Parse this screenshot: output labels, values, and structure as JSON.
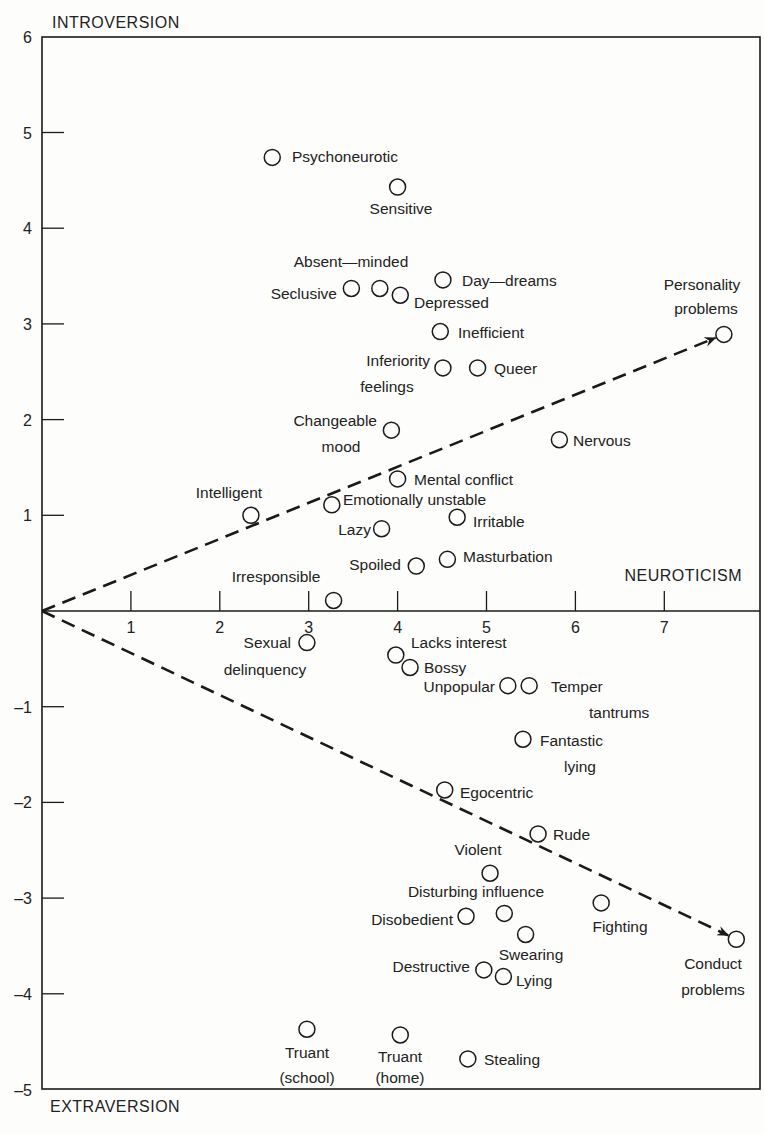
{
  "chart_data": {
    "type": "scatter",
    "title": "",
    "xlabel": "NEUROTICISM",
    "ylabel_top": "INTROVERSION",
    "ylabel_bottom": "EXTRAVERSION",
    "xlim": [
      0,
      7.6
    ],
    "ylim": [
      -5,
      6
    ],
    "x_ticks": [
      1,
      2,
      3,
      4,
      5,
      6,
      7
    ],
    "y_ticks": [
      6,
      5,
      4,
      3,
      2,
      1,
      -1,
      -2,
      -3,
      -4,
      -5
    ],
    "grid": false,
    "marker": "open-circle",
    "vectors": [
      {
        "name": "Personality problems",
        "from": [
          0,
          0
        ],
        "to": [
          7.67,
          2.89
        ],
        "style": "dashed-arrow"
      },
      {
        "name": "Conduct problems",
        "from": [
          0,
          0
        ],
        "to": [
          7.81,
          -3.43
        ],
        "style": "dashed-arrow"
      }
    ],
    "points": [
      {
        "label": "Psychoneurotic",
        "x": 2.59,
        "y": 4.74,
        "lx": 292,
        "ly": 162,
        "anchor": "start"
      },
      {
        "label": "Sensitive",
        "x": 4.0,
        "y": 4.43,
        "lx": 401,
        "ly": 214,
        "anchor": "middle"
      },
      {
        "label": "Absent—minded",
        "x": 3.8,
        "y": 3.37,
        "lx": 351,
        "ly": 267,
        "anchor": "middle"
      },
      {
        "label": "Seclusive",
        "x": 3.48,
        "y": 3.37,
        "lx": 337,
        "ly": 299,
        "anchor": "end"
      },
      {
        "label": "Depressed",
        "x": 4.03,
        "y": 3.3,
        "lx": 414,
        "ly": 308,
        "anchor": "start"
      },
      {
        "label": "Day—dreams",
        "x": 4.51,
        "y": 3.46,
        "lx": 462,
        "ly": 286,
        "anchor": "start"
      },
      {
        "label": "Inefficient",
        "x": 4.48,
        "y": 2.92,
        "lx": 458,
        "ly": 338,
        "anchor": "start"
      },
      {
        "label": "Inferiority",
        "label2": "feelings",
        "x": 4.51,
        "y": 2.54,
        "lx": 430,
        "ly": 366,
        "anchor": "end",
        "l2x": 387,
        "l2y": 392
      },
      {
        "label": "Queer",
        "x": 4.9,
        "y": 2.54,
        "lx": 494,
        "ly": 374,
        "anchor": "start"
      },
      {
        "label": "Changeable",
        "label2": "mood",
        "x": 3.93,
        "y": 1.89,
        "lx": 377,
        "ly": 426,
        "anchor": "end",
        "l2x": 341,
        "l2y": 452
      },
      {
        "label": "Nervous",
        "x": 5.82,
        "y": 1.79,
        "lx": 573,
        "ly": 446,
        "anchor": "start"
      },
      {
        "label": "Mental  conflict",
        "x": 4.0,
        "y": 1.38,
        "lx": 414,
        "ly": 485,
        "anchor": "start"
      },
      {
        "label": "Intelligent",
        "x": 2.35,
        "y": 1.0,
        "lx": 229,
        "ly": 498,
        "anchor": "middle"
      },
      {
        "label": "Emotionally  unstable",
        "x": 3.26,
        "y": 1.11,
        "lx": 343,
        "ly": 505,
        "anchor": "start"
      },
      {
        "label": "Irritable",
        "x": 4.67,
        "y": 0.98,
        "lx": 473,
        "ly": 527,
        "anchor": "start"
      },
      {
        "label": "Lazy",
        "x": 3.82,
        "y": 0.86,
        "lx": 371,
        "ly": 535,
        "anchor": "end"
      },
      {
        "label": "Spoiled",
        "x": 4.21,
        "y": 0.47,
        "lx": 401,
        "ly": 570,
        "anchor": "end"
      },
      {
        "label": "Masturbation",
        "x": 4.56,
        "y": 0.54,
        "lx": 463,
        "ly": 562,
        "anchor": "start"
      },
      {
        "label": "Irresponsible",
        "x": 3.28,
        "y": 0.11,
        "lx": 276,
        "ly": 582,
        "anchor": "middle"
      },
      {
        "label": "Personality",
        "label2": "problems",
        "x": 7.67,
        "y": 2.89,
        "lx": 702,
        "ly": 290,
        "anchor": "middle",
        "l2x": 706,
        "l2y": 314
      },
      {
        "label": "Sexual",
        "label2": "delinquency",
        "x": 2.98,
        "y": -0.33,
        "lx": 291,
        "ly": 648,
        "anchor": "end",
        "l2x": 265,
        "l2y": 675
      },
      {
        "label": "Lacks  interest",
        "x": 3.98,
        "y": -0.46,
        "lx": 411,
        "ly": 648,
        "anchor": "start"
      },
      {
        "label": "Bossy",
        "x": 4.14,
        "y": -0.59,
        "lx": 424,
        "ly": 673,
        "anchor": "start"
      },
      {
        "label": "Unpopular",
        "x": 5.24,
        "y": -0.78,
        "lx": 495,
        "ly": 692,
        "anchor": "end"
      },
      {
        "label": "Temper",
        "label2": "tantrums",
        "x": 5.48,
        "y": -0.78,
        "lx": 551,
        "ly": 692,
        "anchor": "start",
        "l2x": 589,
        "l2y": 718
      },
      {
        "label": "Fantastic",
        "label2": "lying",
        "x": 5.41,
        "y": -1.34,
        "lx": 540,
        "ly": 746,
        "anchor": "start",
        "l2x": 564,
        "l2y": 772
      },
      {
        "label": "Egocentric",
        "x": 4.53,
        "y": -1.87,
        "lx": 460,
        "ly": 798,
        "anchor": "start"
      },
      {
        "label": "Rude",
        "x": 5.58,
        "y": -2.33,
        "lx": 553,
        "ly": 840,
        "anchor": "start"
      },
      {
        "label": "Violent",
        "x": 5.04,
        "y": -2.74,
        "lx": 478,
        "ly": 855,
        "anchor": "middle"
      },
      {
        "label": "Disturbing  influence",
        "x": 5.2,
        "y": -3.16,
        "lx": 476,
        "ly": 897,
        "anchor": "middle"
      },
      {
        "label": "Disobedient",
        "x": 4.77,
        "y": -3.19,
        "lx": 453,
        "ly": 925,
        "anchor": "end"
      },
      {
        "label": "Swearing",
        "x": 5.44,
        "y": -3.38,
        "lx": 531,
        "ly": 960,
        "anchor": "middle"
      },
      {
        "label": "Fighting",
        "x": 6.29,
        "y": -3.05,
        "lx": 620,
        "ly": 932,
        "anchor": "middle"
      },
      {
        "label": "Destructive",
        "x": 4.97,
        "y": -3.75,
        "lx": 470,
        "ly": 972,
        "anchor": "end"
      },
      {
        "label": "Lying",
        "x": 5.19,
        "y": -3.82,
        "lx": 516,
        "ly": 986,
        "anchor": "start"
      },
      {
        "label": "Conduct",
        "label2": "problems",
        "x": 7.81,
        "y": -3.43,
        "lx": 713,
        "ly": 969,
        "anchor": "middle",
        "l2x": 713,
        "l2y": 995
      },
      {
        "label": "Truant",
        "label2": "(school)",
        "x": 2.98,
        "y": -4.37,
        "lx": 307,
        "ly": 1058,
        "anchor": "middle",
        "l2x": 307,
        "l2y": 1083
      },
      {
        "label": "Truant",
        "label2": "(home)",
        "x": 4.03,
        "y": -4.43,
        "lx": 400,
        "ly": 1062,
        "anchor": "middle",
        "l2x": 400,
        "l2y": 1083
      },
      {
        "label": "Stealing",
        "x": 4.79,
        "y": -4.68,
        "lx": 484,
        "ly": 1065,
        "anchor": "start"
      }
    ]
  }
}
